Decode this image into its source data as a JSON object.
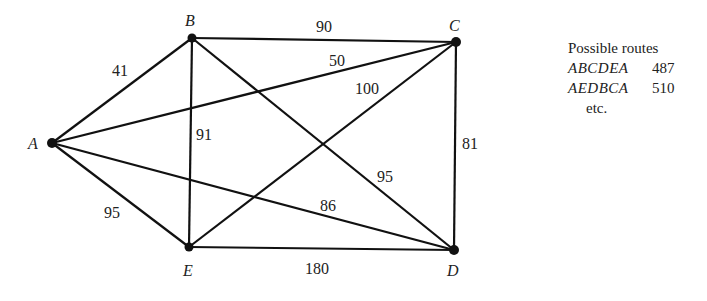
{
  "graph": {
    "nodes": [
      {
        "id": "A",
        "label": "A",
        "x": 52,
        "y": 143
      },
      {
        "id": "B",
        "label": "B",
        "x": 192,
        "y": 38
      },
      {
        "id": "C",
        "label": "C",
        "x": 456,
        "y": 42
      },
      {
        "id": "D",
        "label": "D",
        "x": 454,
        "y": 250
      },
      {
        "id": "E",
        "label": "E",
        "x": 189,
        "y": 247
      }
    ],
    "edges": [
      {
        "from": "A",
        "to": "B",
        "weight": "41"
      },
      {
        "from": "B",
        "to": "C",
        "weight": "90"
      },
      {
        "from": "A",
        "to": "C",
        "weight": "50"
      },
      {
        "from": "E",
        "to": "C",
        "weight": "100"
      },
      {
        "from": "B",
        "to": "E",
        "weight": "91"
      },
      {
        "from": "C",
        "to": "D",
        "weight": "81"
      },
      {
        "from": "B",
        "to": "D",
        "weight": "95"
      },
      {
        "from": "A",
        "to": "D",
        "weight": "86"
      },
      {
        "from": "A",
        "to": "E",
        "weight": "95"
      },
      {
        "from": "E",
        "to": "D",
        "weight": "180"
      }
    ]
  },
  "legend": {
    "title": "Possible routes",
    "routes": [
      {
        "route": "ABCDEA",
        "cost": "487"
      },
      {
        "route": "AEDBCA",
        "cost": "510"
      }
    ],
    "etc": "etc."
  }
}
